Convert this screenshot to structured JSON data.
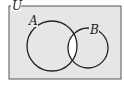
{
  "diagram": {
    "type": "venn",
    "universe_label": "U",
    "sets": [
      {
        "label": "A"
      },
      {
        "label": "B"
      }
    ],
    "shaded_region": "U minus (A ∩ B)",
    "unshaded_region": "A ∩ B",
    "colors": {
      "shade": "#e6e6e6",
      "unshaded": "#ffffff",
      "stroke": "#222222"
    }
  }
}
